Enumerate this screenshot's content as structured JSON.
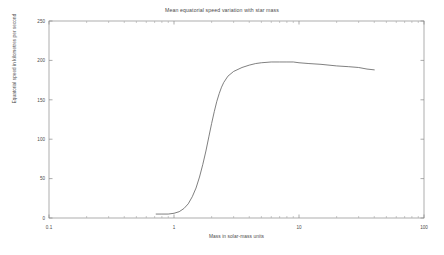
{
  "chart_data": {
    "type": "line",
    "title": "Mean equatorial speed variation with star mass",
    "xlabel": "Mass in solar-mass units",
    "ylabel": "Equatorial speed in kilometres per second",
    "xscale": "log",
    "yscale": "linear",
    "xlim": [
      0.1,
      100
    ],
    "ylim": [
      0,
      250
    ],
    "grid": false,
    "legend": null,
    "xticks": [
      0.1,
      1,
      10,
      100
    ],
    "xtick_labels": [
      "0.1",
      "1",
      "10",
      "100"
    ],
    "yticks": [
      0,
      50,
      100,
      150,
      200,
      250
    ],
    "ytick_labels": [
      "0",
      "50",
      "100",
      "150",
      "200",
      "250"
    ],
    "line_color": "#555555",
    "series": [
      {
        "name": "mean equatorial speed",
        "x": [
          0.72,
          0.8,
          0.9,
          1.0,
          1.1,
          1.2,
          1.3,
          1.4,
          1.5,
          1.6,
          1.7,
          1.8,
          1.9,
          2.0,
          2.1,
          2.2,
          2.3,
          2.4,
          2.5,
          2.7,
          3.0,
          3.5,
          4.0,
          4.5,
          5.0,
          6.0,
          7.0,
          8.0,
          9.0,
          10.0,
          12.0,
          15.0,
          20.0,
          25.0,
          30.0,
          35.0,
          40.0
        ],
        "y": [
          5,
          5,
          5,
          6,
          8,
          12,
          18,
          27,
          38,
          52,
          68,
          85,
          103,
          120,
          135,
          148,
          158,
          166,
          172,
          180,
          186,
          191,
          194,
          196,
          197,
          198,
          198,
          198,
          198,
          197,
          196,
          195,
          193,
          192,
          191,
          189,
          188
        ]
      }
    ]
  },
  "axis_geometry": {
    "left": 49,
    "right": 424,
    "top": 21,
    "bottom": 218
  }
}
